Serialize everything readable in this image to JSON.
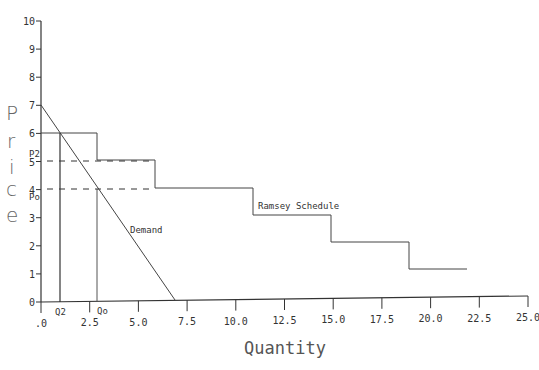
{
  "chart_data": {
    "type": "line",
    "title": "",
    "xlabel": "Quantity",
    "ylabel": "Price",
    "xlim": [
      0,
      25
    ],
    "ylim": [
      0,
      10
    ],
    "x_ticks": [
      ".0",
      "2.5",
      "5.0",
      "7.5",
      "10.0",
      "12.5",
      "15.0",
      "17.5",
      "20.0",
      "22.5",
      "25.0"
    ],
    "y_ticks": [
      "0",
      "1",
      "2",
      "3",
      "4",
      "5",
      "6",
      "7",
      "8",
      "9",
      "10"
    ],
    "grid": false,
    "legend": null,
    "series": [
      {
        "name": "Demand",
        "type": "line",
        "points": [
          [
            0,
            7
          ],
          [
            7,
            0
          ]
        ]
      },
      {
        "name": "Ramsey Schedule",
        "type": "step",
        "steps": [
          {
            "price": 6,
            "q_from": 0,
            "q_to": 3
          },
          {
            "price": 5,
            "q_from": 3,
            "q_to": 6
          },
          {
            "price": 4,
            "q_from": 6,
            "q_to": 11
          },
          {
            "price": 3,
            "q_from": 11,
            "q_to": 15
          },
          {
            "price": 2,
            "q_from": 15,
            "q_to": 19
          },
          {
            "price": 1,
            "q_from": 19,
            "q_to": 22
          }
        ]
      }
    ],
    "annotations": [
      {
        "text": "P2",
        "type": "y-marker",
        "value": 5,
        "dashed_to_q": 6
      },
      {
        "text": "Po",
        "type": "y-marker",
        "value": 4,
        "dashed_to_q": 6
      },
      {
        "text": "Q2",
        "type": "x-marker",
        "value": 1,
        "vertical_to_price": 6
      },
      {
        "text": "Qo",
        "type": "x-marker",
        "value": 3,
        "vertical_to_price": 4
      },
      {
        "text": "Demand",
        "type": "label"
      },
      {
        "text": "Ramsey Schedule",
        "type": "label"
      }
    ]
  },
  "labels": {
    "ylabel_chars": [
      "P",
      "r",
      "i",
      "c",
      "e"
    ],
    "xlabel": "Quantity",
    "demand": "Demand",
    "ramsey": "Ramsey Schedule",
    "p2": "P2",
    "po": "Po",
    "q2": "Q2",
    "qo": "Qo",
    "xticks": [
      ".0",
      "2.5",
      "5.0",
      "7.5",
      "10.0",
      "12.5",
      "15.0",
      "17.5",
      "20.0",
      "22.5",
      "25.0"
    ],
    "yticks": [
      "0",
      "1",
      "2",
      "3",
      "4",
      "5",
      "6",
      "7",
      "8",
      "9",
      "10"
    ]
  }
}
